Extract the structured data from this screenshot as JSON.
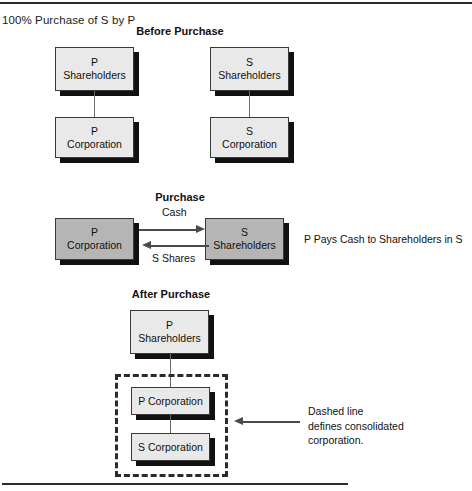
{
  "figure": {
    "title": "100% Purchase of S by P",
    "sections": [
      {
        "key": "before",
        "heading": "Before Purchase"
      },
      {
        "key": "purchase",
        "heading": "Purchase"
      },
      {
        "key": "after",
        "heading": "After Purchase"
      }
    ]
  },
  "before": {
    "p_shareholders": {
      "line1": "P",
      "line2": "Shareholders"
    },
    "s_shareholders": {
      "line1": "S",
      "line2": "Shareholders"
    },
    "p_corporation": {
      "line1": "P",
      "line2": "Corporation"
    },
    "s_corporation": {
      "line1": "S",
      "line2": "Corporation"
    }
  },
  "purchase": {
    "p_corporation": {
      "line1": "P",
      "line2": "Corporation"
    },
    "s_shareholders": {
      "line1": "S",
      "line2": "Shareholders"
    },
    "edge_cash": "Cash",
    "edge_s_shares": "S Shares",
    "note": "P Pays Cash to Shareholders in S"
  },
  "after": {
    "p_shareholders": {
      "line1": "P",
      "line2": "Shareholders"
    },
    "p_corporation": {
      "line1": "P Corporation"
    },
    "s_corporation": {
      "line1": "S Corporation"
    },
    "note": {
      "line1": "Dashed line",
      "line2": "defines consolidated",
      "line3": "corporation."
    }
  },
  "colors": {
    "box_fill_light": "#e9e9e9",
    "box_fill_dark": "#b5b5b5",
    "box_border": "#3a3a3a",
    "box_shadow": "#111111",
    "rule": "#2b2b2b",
    "connector": "#6a6a6a",
    "arrow": "#4a4a4a",
    "dashed_border": "#2b2b2b",
    "text": "#111111"
  }
}
